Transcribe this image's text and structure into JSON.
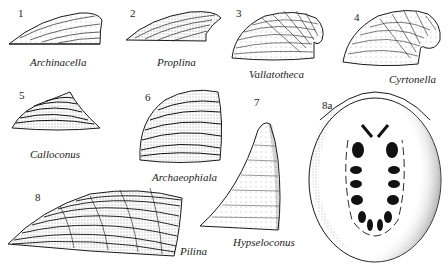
{
  "figure": {
    "type": "scientific-illustration",
    "colors": {
      "ink": "#1a1a1a",
      "paper": "#ffffff",
      "stipple": "#555555"
    },
    "specimens": [
      {
        "number": "1",
        "genus": "Archinacella"
      },
      {
        "number": "2",
        "genus": "Proplina"
      },
      {
        "number": "3",
        "genus": "Vallatotheca"
      },
      {
        "number": "4",
        "genus": "Cyrtonella"
      },
      {
        "number": "5",
        "genus": "Calloconus"
      },
      {
        "number": "6",
        "genus": "Archaeophiala"
      },
      {
        "number": "7",
        "genus": "Hypseloconus"
      },
      {
        "number": "8",
        "genus": "Pilina"
      },
      {
        "number": "8a",
        "genus": ""
      }
    ]
  }
}
